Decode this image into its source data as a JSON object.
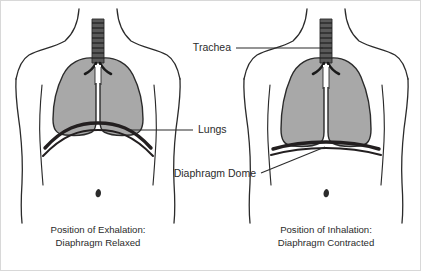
{
  "figure": {
    "background_color": "#ffffff",
    "outline_color": "#2b2b2b",
    "lung_fill_color": "#a8a8a8",
    "diaphragm_color": "#231f20",
    "label_text_color": "#2b2b2b"
  },
  "labels": {
    "trachea": "Trachea",
    "lungs": "Lungs",
    "diaphragm_dome": "Diaphragm Dome"
  },
  "panels": [
    {
      "id": "exhalation",
      "caption_line1": "Position of Exhalation:",
      "caption_line2": "Diaphragm Relaxed",
      "diaphragm_state": "relaxed",
      "diaphragm_shape": "domed",
      "lung_state": "deflated"
    },
    {
      "id": "inhalation",
      "caption_line1": "Position of Inhalation:",
      "caption_line2": "Diaphragm Contracted",
      "diaphragm_state": "contracted",
      "diaphragm_shape": "flattened",
      "lung_state": "inflated"
    }
  ],
  "anatomy_parts": [
    "torso-outline",
    "trachea",
    "bronchi",
    "lungs",
    "diaphragm",
    "ribcage-margin",
    "navel"
  ]
}
